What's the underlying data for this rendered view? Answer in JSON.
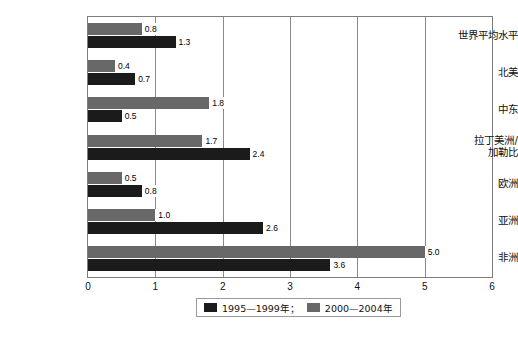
{
  "chart_data": {
    "type": "bar",
    "orientation": "horizontal",
    "title": "",
    "xlabel": "",
    "ylabel": "",
    "xlim": [
      0,
      6
    ],
    "xticks": [
      "0",
      "1",
      "2",
      "3",
      "4",
      "5",
      "6"
    ],
    "grid": true,
    "legend_position": "bottom",
    "categories": [
      "世界平均水平",
      "北美",
      "中东",
      "拉丁美洲/\n加勒比",
      "欧洲",
      "亚洲",
      "非洲"
    ],
    "series": [
      {
        "name": "1995—1999年；",
        "color": "#1b1b1b",
        "values": [
          1.3,
          0.7,
          0.5,
          2.4,
          0.8,
          2.6,
          3.6
        ],
        "labels": [
          "1.3",
          "0.7",
          "0.5",
          "2.4",
          "0.8",
          "2.6",
          "3.6"
        ]
      },
      {
        "name": "2000—2004年",
        "color": "#686868",
        "values": [
          0.8,
          0.4,
          1.8,
          1.7,
          0.5,
          1.0,
          5.0
        ],
        "labels": [
          "0.8",
          "0.4",
          "1.8",
          "1.7",
          "0.5",
          "1.0",
          "5.0"
        ]
      }
    ]
  },
  "legend": {
    "items": [
      {
        "label": "1995—1999年；",
        "color": "#1b1b1b"
      },
      {
        "label": "2000—2004年",
        "color": "#686868"
      }
    ]
  },
  "caption": {
    "text": ""
  }
}
